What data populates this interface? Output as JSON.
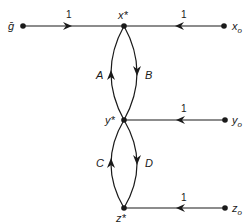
{
  "diagram": {
    "type": "signal-flow-graph",
    "nodes": [
      {
        "id": "g",
        "label": "ḡ"
      },
      {
        "id": "x_star",
        "label": "x*"
      },
      {
        "id": "x0",
        "label": "x",
        "sub": "o"
      },
      {
        "id": "y_star",
        "label": "y*"
      },
      {
        "id": "y0",
        "label": "y",
        "sub": "o"
      },
      {
        "id": "z_star",
        "label": "z*"
      },
      {
        "id": "z0",
        "label": "z",
        "sub": "o"
      }
    ],
    "edges": [
      {
        "from": "g",
        "to": "x_star",
        "gain": "1"
      },
      {
        "from": "x0",
        "to": "x_star",
        "gain": "1"
      },
      {
        "from": "y_star",
        "to": "x_star",
        "gain": "A"
      },
      {
        "from": "x_star",
        "to": "y_star",
        "gain": "B"
      },
      {
        "from": "y0",
        "to": "y_star",
        "gain": "1"
      },
      {
        "from": "z_star",
        "to": "y_star",
        "gain": "C"
      },
      {
        "from": "y_star",
        "to": "z_star",
        "gain": "D"
      },
      {
        "from": "z0",
        "to": "z_star",
        "gain": "1"
      }
    ]
  }
}
